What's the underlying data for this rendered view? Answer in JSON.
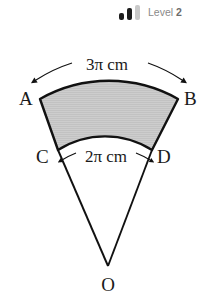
{
  "badge": {
    "label_prefix": "Level",
    "level_value": "2",
    "bars": [
      {
        "name": "bar-low",
        "active": true,
        "color": "#1c1c1c"
      },
      {
        "name": "bar-mid",
        "active": true,
        "color": "#1c1c1c"
      },
      {
        "name": "bar-high",
        "active": false,
        "color": "#c9c9c9"
      }
    ]
  },
  "figure": {
    "type": "annular-sector",
    "vertex_label": "O",
    "outer_arc": {
      "start_label": "A",
      "end_label": "B",
      "dimension_text": "3π cm"
    },
    "inner_arc": {
      "start_label": "C",
      "end_label": "D",
      "dimension_text": "2π cm"
    },
    "colors": {
      "stroke": "#111111",
      "fill": "#c8c8c8",
      "background": "#ffffff"
    }
  }
}
